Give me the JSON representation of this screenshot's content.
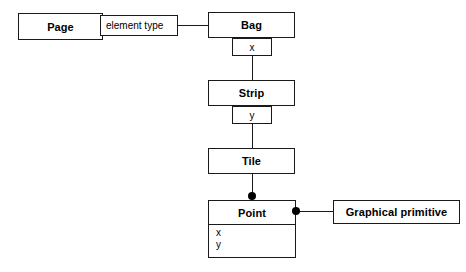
{
  "diagram": {
    "type": "class-diagram",
    "classes": [
      {
        "id": "page",
        "name": "Page",
        "attributes": []
      },
      {
        "id": "bag",
        "name": "Bag",
        "attributes": []
      },
      {
        "id": "strip",
        "name": "Strip",
        "attributes": []
      },
      {
        "id": "tile",
        "name": "Tile",
        "attributes": []
      },
      {
        "id": "point",
        "name": "Point",
        "attributes": [
          "x",
          "y"
        ]
      },
      {
        "id": "graphical-primitive",
        "name": "Graphical primitive",
        "attributes": []
      }
    ],
    "labels": {
      "element_type": "element type",
      "bag_index": "x",
      "strip_index": "y"
    },
    "point_attributes": {
      "x": "x",
      "y": "y"
    },
    "colors": {
      "line": "#1a1a1a",
      "fill": "#ffffff",
      "text": "#000000",
      "marker": "#000000"
    }
  }
}
